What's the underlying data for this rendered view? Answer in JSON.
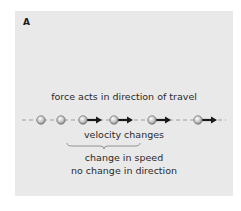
{
  "figure": {
    "panel_label": "A",
    "title": "force acts in direction of travel",
    "velocity_label": "velocity changes",
    "effect_lines": [
      "change in speed",
      "no change in direction"
    ],
    "colors": {
      "background": "#e9e9e9",
      "ball": "#c8c8c8",
      "arrow": "#1a1a1a",
      "line": "#7a7a7a",
      "brace": "#8a8a8a"
    },
    "balls": [
      {
        "x": 41,
        "arrow": false
      },
      {
        "x": 61,
        "arrow": false
      },
      {
        "x": 83,
        "arrow": true
      },
      {
        "x": 114,
        "arrow": true
      },
      {
        "x": 152,
        "arrow": true
      },
      {
        "x": 198,
        "arrow": true
      }
    ]
  }
}
